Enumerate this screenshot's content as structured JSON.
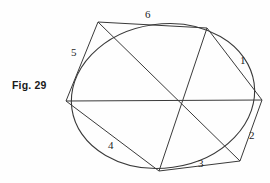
{
  "figure": {
    "caption": "Fig. 29",
    "canvas": {
      "width": 270,
      "height": 183
    },
    "stroke_color": "#3a3a3a",
    "background_color": "#fefefe",
    "point_labels": [
      {
        "id": "1",
        "text": "1",
        "x": 240,
        "y": 55
      },
      {
        "id": "2",
        "text": "2",
        "x": 249,
        "y": 130
      },
      {
        "id": "3",
        "text": "3",
        "x": 198,
        "y": 158
      },
      {
        "id": "4",
        "text": "4",
        "x": 108,
        "y": 140
      },
      {
        "id": "5",
        "text": "5",
        "x": 71,
        "y": 47
      },
      {
        "id": "6",
        "text": "6",
        "x": 145,
        "y": 9
      }
    ],
    "hexagon": {
      "name": "circumscribed-hexagon",
      "vertices": [
        {
          "x": 98,
          "y": 22
        },
        {
          "x": 207,
          "y": 28
        },
        {
          "x": 262,
          "y": 100
        },
        {
          "x": 240,
          "y": 161
        },
        {
          "x": 159,
          "y": 171
        },
        {
          "x": 66,
          "y": 101
        }
      ]
    },
    "diagonals": [
      {
        "name": "diagonal-1-4",
        "from": {
          "x": 98,
          "y": 22
        },
        "to": {
          "x": 240,
          "y": 161
        }
      },
      {
        "name": "diagonal-2-5",
        "from": {
          "x": 207,
          "y": 28
        },
        "to": {
          "x": 159,
          "y": 171
        }
      },
      {
        "name": "diagonal-3-6",
        "from": {
          "x": 262,
          "y": 100
        },
        "to": {
          "x": 66,
          "y": 101
        }
      }
    ],
    "brianchon_point": {
      "x": 181,
      "y": 101
    },
    "ellipse": {
      "name": "inscribed-ellipse",
      "cx": 163,
      "cy": 96,
      "rx": 92,
      "ry": 72,
      "rotation_deg": -8
    }
  },
  "chart_data": {
    "type": "diagram",
    "title": "Fig. 29",
    "labels": [
      "1",
      "2",
      "3",
      "4",
      "5",
      "6"
    ]
  }
}
